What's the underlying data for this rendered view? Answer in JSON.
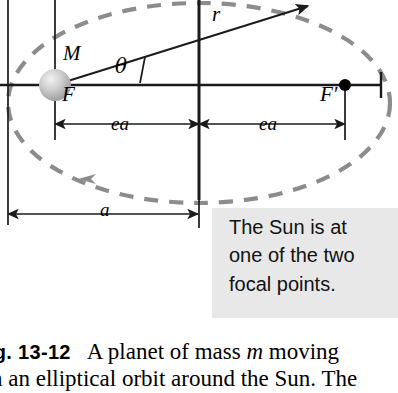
{
  "figure": {
    "type": "physics-diagram",
    "labels": {
      "sun_mass": "M",
      "focus_left": "F",
      "focus_right": "F′",
      "radius_vector": "r",
      "angle": "θ",
      "semi_focal_left": "ea",
      "semi_focal_right": "ea",
      "semi_major": "a"
    },
    "colors": {
      "orbit_dashed": "#8c8c8c",
      "axis_line": "#1a1a1a",
      "callout_background": "#e8e8e8",
      "sun_body": "#b9b9b9",
      "focus_dot": "#000000",
      "text": "#000000"
    }
  },
  "callout": {
    "name": "sun-focal-point-callout",
    "lines": [
      "The Sun is at",
      "one of the two",
      "focal points."
    ]
  },
  "caption": {
    "figure_number": "ig. 13-12",
    "line1_text": "A planet of mass ",
    "line1_italic": "m",
    "line1_tail": " moving",
    "line2": "n an elliptical orbit around the Sun. The"
  }
}
